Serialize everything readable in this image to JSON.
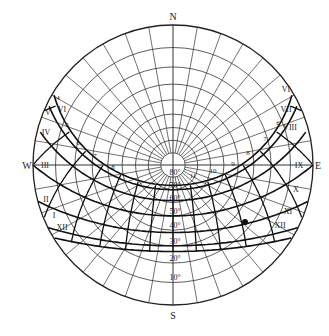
{
  "diagram": {
    "type": "stereographic sun-path chart",
    "compass": {
      "north": "N",
      "south": "S",
      "east": "E",
      "west": "W"
    },
    "altitude_labels": [
      "10°",
      "20°",
      "30°",
      "40°",
      "50°",
      "60°",
      "70°",
      "80°"
    ],
    "hour_labels_left": [
      "V",
      "VI",
      "IV",
      "III",
      "II",
      "I",
      "XII"
    ],
    "hour_labels_right": [
      "VI",
      "VII",
      "VIII",
      "IX",
      "X",
      "XI",
      "XII"
    ],
    "hour_numbers_left": [
      "4",
      "5",
      "6",
      "7",
      "8"
    ],
    "hour_numbers_right": [
      "6",
      "7",
      "8",
      "9",
      "10",
      "11"
    ],
    "colors": {
      "line": "#222222",
      "background": "#ffffff"
    }
  }
}
